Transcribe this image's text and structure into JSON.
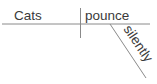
{
  "diagram": {
    "type": "sentence-diagram",
    "subject": "Cats",
    "verb": "pounce",
    "modifier": "silently",
    "colors": {
      "line": "#8a8a8a",
      "text": "#3a3a3a",
      "background": "#ffffff"
    }
  }
}
